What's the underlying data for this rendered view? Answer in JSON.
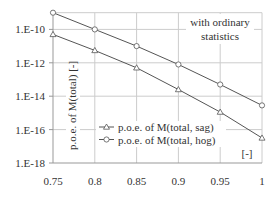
{
  "chart_data": {
    "type": "line",
    "title": "",
    "xlabel": "",
    "ylabel": "p.o.e. of M(total) [-]",
    "x_unit_label": "[-]",
    "annotation": [
      "with ordinary",
      "statistics"
    ],
    "x": [
      0.75,
      0.8,
      0.85,
      0.9,
      0.95,
      1.0
    ],
    "xlim": [
      0.75,
      1.0
    ],
    "x_ticks": [
      "0.75",
      "0.8",
      "0.85",
      "0.9",
      "0.95",
      "1"
    ],
    "y_scale": "log",
    "ylim": [
      1e-18,
      1e-09
    ],
    "y_ticks": [
      "1.E-10",
      "1.E-12",
      "1.E-14",
      "1.E-16",
      "1.E-18"
    ],
    "grid": true,
    "legend_position": "lower-left-inside",
    "series": [
      {
        "name": "p.o.e. of M(total, sag)",
        "marker": "triangle",
        "log10_values": [
          -10.3,
          -11.26,
          -12.3,
          -13.6,
          -14.95,
          -16.5
        ],
        "values": [
          5e-11,
          5.5e-12,
          5e-13,
          2.5e-14,
          1.1e-15,
          3.2e-17
        ]
      },
      {
        "name": "p.o.e. of M(total, hog)",
        "marker": "circle",
        "log10_values": [
          -9.0,
          -10.0,
          -11.0,
          -12.1,
          -13.3,
          -14.55
        ],
        "values": [
          1e-09,
          1e-10,
          1e-11,
          8e-13,
          5e-14,
          2.8e-15
        ]
      }
    ],
    "colors": {
      "line": "#555555",
      "grid": "#cccccc",
      "axis": "#999999",
      "text": "#333333"
    }
  }
}
